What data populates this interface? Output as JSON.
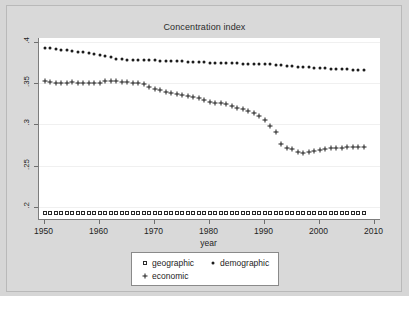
{
  "chart_data": {
    "type": "scatter",
    "title": "Concentration index",
    "xlabel": "year",
    "ylabel": "",
    "xlim": [
      1949,
      2011
    ],
    "ylim": [
      0.185,
      0.405
    ],
    "grid": true,
    "legend_position": "bottom-center",
    "xticks": [
      "1950",
      "1960",
      "1970",
      "1980",
      "1990",
      "2000",
      "2010"
    ],
    "xtick_values": [
      1950,
      1960,
      1970,
      1980,
      1990,
      2000,
      2010
    ],
    "yticks": [
      ".2",
      ".25",
      ".3",
      ".35",
      ".4"
    ],
    "ytick_values": [
      0.2,
      0.25,
      0.3,
      0.35,
      0.4
    ],
    "x": [
      1950,
      1951,
      1952,
      1953,
      1954,
      1955,
      1956,
      1957,
      1958,
      1959,
      1960,
      1961,
      1962,
      1963,
      1964,
      1965,
      1966,
      1967,
      1968,
      1969,
      1970,
      1971,
      1972,
      1973,
      1974,
      1975,
      1976,
      1977,
      1978,
      1979,
      1980,
      1981,
      1982,
      1983,
      1984,
      1985,
      1986,
      1987,
      1988,
      1989,
      1990,
      1991,
      1992,
      1993,
      1994,
      1995,
      1996,
      1997,
      1998,
      1999,
      2000,
      2001,
      2002,
      2003,
      2004,
      2005,
      2006,
      2007,
      2008
    ],
    "series": [
      {
        "name": "geographic",
        "marker": "square",
        "values": [
          0.1925,
          0.1925,
          0.1925,
          0.1925,
          0.1925,
          0.1925,
          0.1925,
          0.1925,
          0.1925,
          0.1925,
          0.1925,
          0.1925,
          0.1925,
          0.1925,
          0.1925,
          0.1925,
          0.1925,
          0.1925,
          0.1925,
          0.1925,
          0.1925,
          0.1925,
          0.1925,
          0.1925,
          0.1925,
          0.1925,
          0.1925,
          0.1925,
          0.1925,
          0.1925,
          0.1925,
          0.1925,
          0.1925,
          0.1925,
          0.1925,
          0.1925,
          0.1925,
          0.1925,
          0.1925,
          0.1925,
          0.1925,
          0.1925,
          0.1925,
          0.1925,
          0.1925,
          0.1925,
          0.1925,
          0.1925,
          0.1925,
          0.1925,
          0.1925,
          0.1925,
          0.1925,
          0.1925,
          0.1925,
          0.1925,
          0.1925,
          0.1925,
          0.1925
        ]
      },
      {
        "name": "demographic",
        "marker": "dot",
        "values": [
          0.3925,
          0.3925,
          0.3915,
          0.3905,
          0.39,
          0.3895,
          0.3885,
          0.3875,
          0.3865,
          0.3855,
          0.3845,
          0.383,
          0.3815,
          0.38,
          0.379,
          0.3785,
          0.3782,
          0.378,
          0.378,
          0.3778,
          0.3778,
          0.3775,
          0.3772,
          0.377,
          0.3768,
          0.3765,
          0.3762,
          0.376,
          0.3758,
          0.3755,
          0.3752,
          0.375,
          0.375,
          0.3748,
          0.3745,
          0.3742,
          0.374,
          0.374,
          0.3738,
          0.3735,
          0.3732,
          0.3728,
          0.3725,
          0.372,
          0.3715,
          0.3708,
          0.3702,
          0.3698,
          0.3695,
          0.369,
          0.3685,
          0.368,
          0.3678,
          0.3675,
          0.3672,
          0.367,
          0.3665,
          0.366,
          0.3658
        ]
      },
      {
        "name": "economic",
        "marker": "plus",
        "values": [
          0.3525,
          0.351,
          0.3508,
          0.3505,
          0.3508,
          0.351,
          0.3508,
          0.3505,
          0.35,
          0.3498,
          0.3505,
          0.3528,
          0.353,
          0.3525,
          0.3518,
          0.3512,
          0.3505,
          0.3498,
          0.3488,
          0.345,
          0.343,
          0.3412,
          0.3398,
          0.3385,
          0.337,
          0.3358,
          0.3345,
          0.3335,
          0.332,
          0.33,
          0.3275,
          0.3258,
          0.3265,
          0.3245,
          0.3225,
          0.3205,
          0.3185,
          0.316,
          0.3135,
          0.31,
          0.3055,
          0.2975,
          0.2905,
          0.276,
          0.2718,
          0.27,
          0.2665,
          0.265,
          0.266,
          0.2672,
          0.2685,
          0.27,
          0.271,
          0.2715,
          0.2718,
          0.272,
          0.2722,
          0.2725,
          0.2728
        ]
      }
    ],
    "legend": [
      {
        "label": "geographic",
        "marker": "square"
      },
      {
        "label": "demographic",
        "marker": "dot"
      },
      {
        "label": "economic",
        "marker": "plus"
      }
    ]
  }
}
